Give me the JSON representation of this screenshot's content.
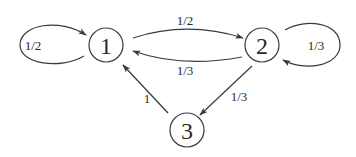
{
  "diagram": {
    "type": "markov-chain-state-diagram",
    "nodes": [
      {
        "id": "1",
        "label": "1"
      },
      {
        "id": "2",
        "label": "2"
      },
      {
        "id": "3",
        "label": "3"
      }
    ],
    "edges": [
      {
        "from": "1",
        "to": "1",
        "label": "1/2",
        "kind": "self-loop"
      },
      {
        "from": "1",
        "to": "2",
        "label": "1/2"
      },
      {
        "from": "2",
        "to": "1",
        "label": "1/3"
      },
      {
        "from": "2",
        "to": "2",
        "label": "1/3",
        "kind": "self-loop"
      },
      {
        "from": "2",
        "to": "3",
        "label": "1/3"
      },
      {
        "from": "3",
        "to": "1",
        "label": "1"
      }
    ],
    "colors": {
      "stroke": "#3a3a3a",
      "text": "#2a2a2a",
      "background": "#ffffff"
    }
  }
}
